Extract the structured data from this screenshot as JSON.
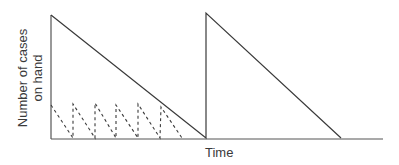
{
  "chart_data": {
    "type": "line",
    "title": "",
    "xlabel": "Time",
    "ylabel": "Number of cases on hand",
    "ylabel_lines": [
      "Number of cases",
      "on hand"
    ],
    "grid": false,
    "legend": null,
    "axes": {
      "origin_px": [
        51,
        139
      ],
      "x_end_px": 383,
      "y_top_px": 15
    },
    "series": [
      {
        "name": "Large order sawtooth (solid)",
        "style": "solid",
        "points_px": [
          [
            51,
            15
          ],
          [
            206,
            138
          ],
          [
            206,
            13
          ],
          [
            341,
            138
          ]
        ]
      },
      {
        "name": "Small frequent orders sawtooth (dashed)",
        "style": "dashed",
        "points_px": [
          [
            51,
            105
          ],
          [
            73,
            138
          ],
          [
            73,
            104
          ],
          [
            95,
            138
          ],
          [
            95,
            103
          ],
          [
            116,
            138
          ],
          [
            116,
            105
          ],
          [
            138,
            138
          ],
          [
            138,
            104
          ],
          [
            160,
            138
          ],
          [
            161,
            107
          ],
          [
            182,
            138
          ]
        ]
      }
    ]
  },
  "labels": {
    "x_axis": "Time",
    "y_axis_line1": "Number of cases",
    "y_axis_line2": "on hand"
  },
  "colors": {
    "line": "#3a3a3a",
    "axis": "#555555"
  }
}
